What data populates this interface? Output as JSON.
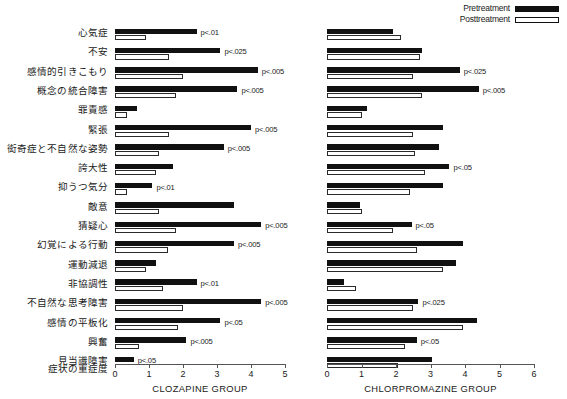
{
  "legend": {
    "position": "top-right",
    "items": [
      {
        "label": "Pretreatment",
        "style": "filled",
        "color": "#111111"
      },
      {
        "label": "Posttreatment",
        "style": "outline",
        "color": "#ffffff"
      }
    ]
  },
  "severity_axis_label": "症状の重症度",
  "chart_data": [
    {
      "type": "bar",
      "orientation": "horizontal",
      "title": "CLOZAPINE GROUP",
      "xlabel": "症状の重症度",
      "ylabel": "",
      "xlim": [
        0,
        5
      ],
      "xticks": [
        0,
        1,
        2,
        3,
        4,
        5
      ],
      "xticklabels": [
        "0",
        "1",
        "2",
        "3",
        "4",
        "5"
      ],
      "grid": false,
      "legend": [
        "Pretreatment",
        "Posttreatment"
      ],
      "categories": [
        "心気症",
        "不安",
        "感情的引きこもり",
        "概念の統合障害",
        "罪責感",
        "緊張",
        "衒奇症と不自然な姿勢",
        "誇大性",
        "抑うつ気分",
        "敵意",
        "猜疑心",
        "幻覚による行動",
        "運動減退",
        "非協調性",
        "不自然な思考障害",
        "感情の平板化",
        "興奮",
        "見当識障害"
      ],
      "series": [
        {
          "name": "Pretreatment",
          "values": [
            2.4,
            3.1,
            4.2,
            3.6,
            0.65,
            4.0,
            3.2,
            1.7,
            1.1,
            3.5,
            4.3,
            3.5,
            1.2,
            2.4,
            4.3,
            3.1,
            2.1,
            0.55
          ]
        },
        {
          "name": "Posttreatment",
          "values": [
            0.9,
            1.6,
            2.0,
            1.8,
            0.35,
            1.6,
            1.3,
            1.2,
            0.35,
            1.3,
            1.8,
            1.55,
            0.9,
            1.4,
            2.0,
            1.85,
            0.7,
            0.0
          ]
        }
      ],
      "annotations": [
        {
          "category": "心気症",
          "text": "p<.01"
        },
        {
          "category": "不安",
          "text": "p<.025"
        },
        {
          "category": "感情的引きこもり",
          "text": "p<.005"
        },
        {
          "category": "概念の統合障害",
          "text": "p<.005"
        },
        {
          "category": "罪責感",
          "text": ""
        },
        {
          "category": "緊張",
          "text": "p<.005"
        },
        {
          "category": "衒奇症と不自然な姿勢",
          "text": "p<.005"
        },
        {
          "category": "誇大性",
          "text": ""
        },
        {
          "category": "抑うつ気分",
          "text": "p<.01"
        },
        {
          "category": "敵意",
          "text": ""
        },
        {
          "category": "猜疑心",
          "text": "p<.005"
        },
        {
          "category": "幻覚による行動",
          "text": "p<.005"
        },
        {
          "category": "運動減退",
          "text": ""
        },
        {
          "category": "非協調性",
          "text": "p<.01"
        },
        {
          "category": "不自然な思考障害",
          "text": "p<.005"
        },
        {
          "category": "感情の平板化",
          "text": "p<.05"
        },
        {
          "category": "興奮",
          "text": "p<.005"
        },
        {
          "category": "見当識障害",
          "text": "p<.05"
        }
      ]
    },
    {
      "type": "bar",
      "orientation": "horizontal",
      "title": "CHLORPROMAZINE GROUP",
      "xlabel": "",
      "ylabel": "",
      "xlim": [
        0,
        6
      ],
      "xticks": [
        0,
        1,
        2,
        3,
        4,
        5,
        6
      ],
      "xticklabels": [
        "0",
        "1",
        "2",
        "3",
        "4",
        "5",
        "6"
      ],
      "grid": false,
      "legend": [
        "Pretreatment",
        "Posttreatment"
      ],
      "categories": [
        "心気症",
        "不安",
        "感情的引きこもり",
        "概念の統合障害",
        "罪責感",
        "緊張",
        "衒奇症と不自然な姿勢",
        "誇大性",
        "抑うつ気分",
        "敵意",
        "猜疑心",
        "幻覚による行動",
        "運動減退",
        "非協調性",
        "不自然な思考障害",
        "感情の平板化",
        "興奮",
        "見当識障害"
      ],
      "series": [
        {
          "name": "Pretreatment",
          "values": [
            1.9,
            2.75,
            3.85,
            4.4,
            1.15,
            3.35,
            3.25,
            3.55,
            3.35,
            0.95,
            2.45,
            3.95,
            3.75,
            0.5,
            2.65,
            4.35,
            2.6,
            3.05,
            0.45
          ]
        },
        {
          "name": "Posttreatment",
          "values": [
            2.15,
            2.7,
            2.5,
            2.75,
            1.0,
            2.5,
            2.55,
            2.85,
            2.4,
            1.0,
            1.9,
            2.6,
            3.35,
            0.85,
            2.5,
            3.95,
            2.25,
            2.05,
            0.5
          ]
        }
      ],
      "annotations": [
        {
          "category": "心気症",
          "text": ""
        },
        {
          "category": "不安",
          "text": ""
        },
        {
          "category": "感情的引きこもり",
          "text": "p<.025"
        },
        {
          "category": "概念の統合障害",
          "text": "p<.005"
        },
        {
          "category": "罪責感",
          "text": ""
        },
        {
          "category": "緊張",
          "text": ""
        },
        {
          "category": "衒奇症と不自然な姿勢",
          "text": ""
        },
        {
          "category": "誇大性",
          "text": "p<.05"
        },
        {
          "category": "抑うつ気分",
          "text": ""
        },
        {
          "category": "敵意",
          "text": ""
        },
        {
          "category": "猜疑心",
          "text": "p<.05"
        },
        {
          "category": "幻覚による行動",
          "text": ""
        },
        {
          "category": "運動減退",
          "text": ""
        },
        {
          "category": "非協調性",
          "text": ""
        },
        {
          "category": "不自然な思考障害",
          "text": "p<.025"
        },
        {
          "category": "感情の平板化",
          "text": ""
        },
        {
          "category": "興奮",
          "text": "p<.05"
        },
        {
          "category": "見当識障害",
          "text": ""
        }
      ]
    }
  ]
}
